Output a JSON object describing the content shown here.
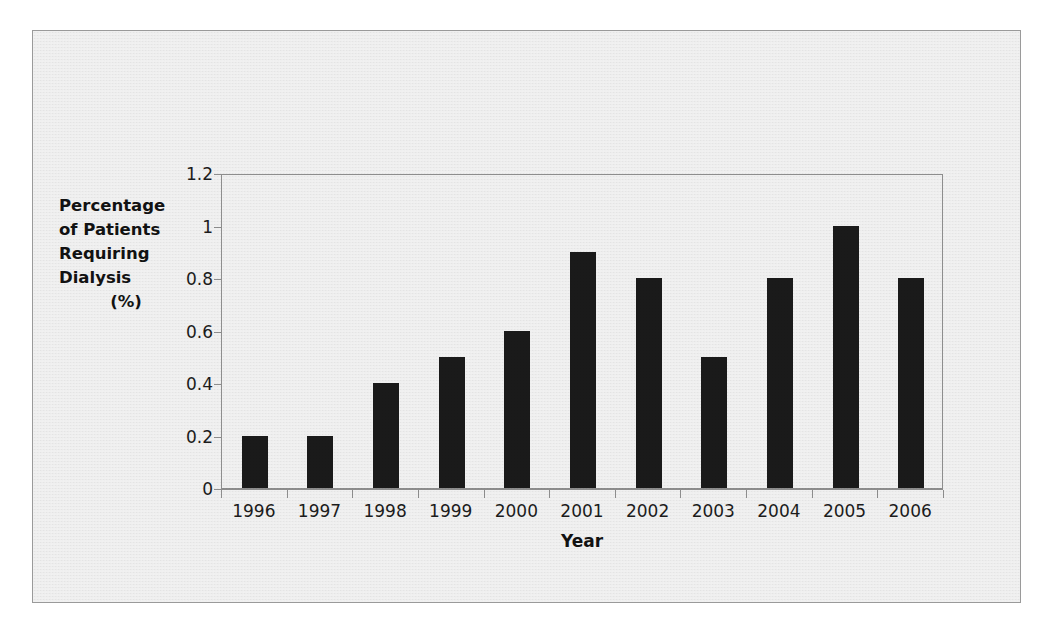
{
  "figure": {
    "background_color": "#e9e9e9",
    "border_color": "#9a9a9a",
    "bar_color": "#1a1a1a",
    "axis_color": "#8d8d8d"
  },
  "axes": {
    "x_title": "Year",
    "y_title_lines": [
      "Percentage",
      "of Patients",
      "Requiring",
      "Dialysis",
      "(%)"
    ],
    "y_ticks": [
      "0",
      "0.2",
      "0.4",
      "0.6",
      "0.8",
      "1",
      "1.2"
    ],
    "x_ticks": [
      "1996",
      "1997",
      "1998",
      "1999",
      "2000",
      "2001",
      "2002",
      "2003",
      "2004",
      "2005",
      "2006"
    ]
  },
  "chart_data": {
    "type": "bar",
    "title": "",
    "xlabel": "Year",
    "ylabel": "Percentage of Patients Requiring Dialysis (%)",
    "categories": [
      "1996",
      "1997",
      "1998",
      "1999",
      "2000",
      "2001",
      "2002",
      "2003",
      "2004",
      "2005",
      "2006"
    ],
    "values": [
      0.2,
      0.2,
      0.4,
      0.5,
      0.6,
      0.9,
      0.8,
      0.5,
      0.8,
      1.0,
      0.8
    ],
    "ylim": [
      0,
      1.2
    ],
    "ytick_values": [
      0,
      0.2,
      0.4,
      0.6,
      0.8,
      1,
      1.2
    ],
    "grid": false,
    "legend": null,
    "series": [
      {
        "name": "Percentage of Patients Requiring Dialysis (%)",
        "values": [
          0.2,
          0.2,
          0.4,
          0.5,
          0.6,
          0.9,
          0.8,
          0.5,
          0.8,
          1.0,
          0.8
        ]
      }
    ]
  }
}
